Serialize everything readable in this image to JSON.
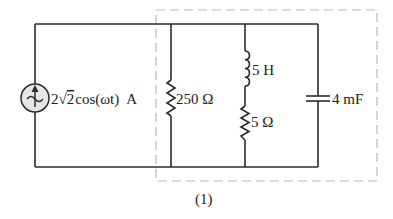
{
  "diagram": {
    "type": "circuit",
    "source": {
      "kind": "ac-current-source",
      "label": "2√2 cos(ωt) A",
      "label_parts": {
        "coef": "2",
        "sqrt_arg": "2",
        "func": "cos(ωt)",
        "unit": "A"
      }
    },
    "components": [
      {
        "id": "R1",
        "kind": "resistor",
        "label": "250 Ω"
      },
      {
        "id": "L1",
        "kind": "inductor",
        "label": "5 H"
      },
      {
        "id": "R2",
        "kind": "resistor",
        "label": "5 Ω"
      },
      {
        "id": "C1",
        "kind": "capacitor",
        "label": "4 mF"
      }
    ],
    "subcircuit_box": {
      "style": "dashed",
      "label": "(1)"
    },
    "colors": {
      "wire": "#2b2b2b",
      "dashed_box": "#b8b8b8",
      "source_fill": "#e6e6e6"
    }
  }
}
